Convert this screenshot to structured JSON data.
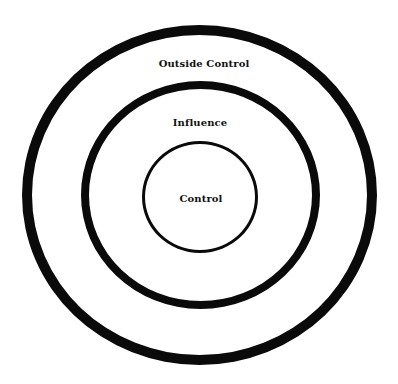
{
  "diagram": {
    "type": "concentric-circles",
    "rings": [
      {
        "id": "outer",
        "label": "Outside Control"
      },
      {
        "id": "middle",
        "label": "Influence"
      },
      {
        "id": "inner",
        "label": "Control"
      }
    ],
    "colors": {
      "stroke": "#0a0a0a",
      "text": "#111111",
      "background": "#ffffff"
    }
  }
}
